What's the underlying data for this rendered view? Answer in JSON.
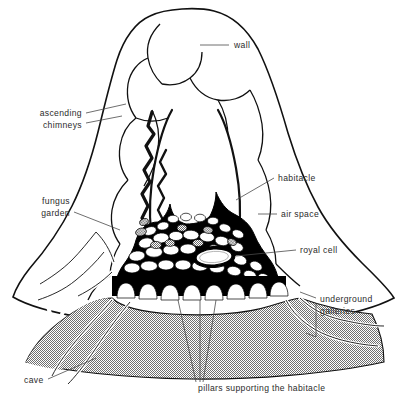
{
  "figure": {
    "background_color": "#ffffff",
    "ink_color": "#111111",
    "hatch_color": "#8d8d8d",
    "label_color": "#2b2b2b"
  },
  "labels": [
    {
      "id": "wall",
      "text": "wall",
      "text_x": 234,
      "text_y": 48,
      "anchor": "start",
      "leader": "M 200,45 L 229,45"
    },
    {
      "id": "ascending-chimneys",
      "text_line1": "ascending",
      "text_line2": "chimneys",
      "text_x": 80,
      "text_y": 118,
      "anchor": "end",
      "leader": "M 84,115 L 116,112 M 84,126 L 112,123"
    },
    {
      "id": "habitacle",
      "text": "habitacle",
      "text_x": 278,
      "text_y": 180,
      "anchor": "start",
      "leader": "M 231,199 L 274,178"
    },
    {
      "id": "air-space",
      "text": "air space",
      "text_x": 281,
      "text_y": 217,
      "anchor": "start",
      "leader": "M 258,214 L 277,214"
    },
    {
      "id": "royal-cell",
      "text": "royal cell",
      "text_x": 300,
      "text_y": 253,
      "anchor": "start",
      "leader": "M 272,250 L 296,250"
    },
    {
      "id": "fungus-garden",
      "text_line1": "fungus",
      "text_line2": "garden",
      "text_x": 68,
      "text_y": 204,
      "anchor": "end",
      "leader": "M 72,213 L 118,228"
    },
    {
      "id": "underground-galleries",
      "text_line1": "underground",
      "text_line2": "galleries",
      "text_x": 320,
      "text_y": 302,
      "anchor": "start",
      "leader": "M 316,299 L 300,294 M 316,308 L 306,333"
    },
    {
      "id": "cave",
      "text": "cave",
      "text_x": 24,
      "text_y": 383,
      "anchor": "start",
      "leader": "M 46,379 L 92,360"
    },
    {
      "id": "pillars-supporting-the-habitacle",
      "text": "pillars supporting the habitacle",
      "text_x": 198,
      "text_y": 390,
      "anchor": "start",
      "leader": "M 196,383 L 175,300 M 200,383 L 200,300 M 204,383 L 218,300"
    }
  ],
  "structures": [
    {
      "id": "mound-outline",
      "name": "mound wall outline"
    },
    {
      "id": "chimney-network",
      "name": "ascending chimneys network"
    },
    {
      "id": "central-air-space",
      "name": "central air space cavity"
    },
    {
      "id": "habitacle-nest",
      "name": "habitacle nursery cells"
    },
    {
      "id": "royal-cell-chamber",
      "name": "royal cell chamber"
    },
    {
      "id": "pillar-row",
      "name": "pillars supporting the habitacle"
    },
    {
      "id": "cave-void",
      "name": "cave beneath habitacle"
    },
    {
      "id": "underground-gallery-lines",
      "name": "underground galleries"
    },
    {
      "id": "fungus-garden-cells",
      "name": "fungus garden combs"
    }
  ]
}
